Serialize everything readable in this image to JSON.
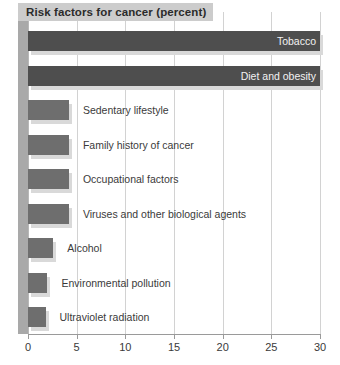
{
  "chart_data": {
    "type": "bar",
    "title": "Risk factors for cancer (percent)",
    "orientation": "horizontal",
    "xlabel": "",
    "ylabel": "",
    "xlim": [
      0,
      30
    ],
    "xticks": [
      0,
      5,
      10,
      15,
      20,
      25,
      30
    ],
    "xtick_labels": [
      "0",
      "5",
      "10",
      "15",
      "20",
      "25",
      "30"
    ],
    "grid": true,
    "legend": "none",
    "categories": [
      "Tobacco",
      "Diet and obesity",
      "Sedentary lifestyle",
      "Family history of cancer",
      "Occupational factors",
      "Viruses and other biological agents",
      "Alcohol",
      "Environmental pollution",
      "Ultraviolet radiation"
    ],
    "values": [
      30,
      30,
      4.2,
      4.2,
      4.2,
      4.2,
      2.6,
      2.0,
      1.8
    ],
    "bars": [
      {
        "label": "Tobacco",
        "value": 30,
        "color": "#4e4e4e",
        "label_position": "inside"
      },
      {
        "label": "Diet and obesity",
        "value": 30,
        "color": "#4e4e4e",
        "label_position": "inside"
      },
      {
        "label": "Sedentary lifestyle",
        "value": 4.2,
        "color": "#6e6e6e",
        "label_position": "outside"
      },
      {
        "label": "Family history of cancer",
        "value": 4.2,
        "color": "#6e6e6e",
        "label_position": "outside"
      },
      {
        "label": "Occupational factors",
        "value": 4.2,
        "color": "#6e6e6e",
        "label_position": "outside"
      },
      {
        "label": "Viruses and other biological agents",
        "value": 4.2,
        "color": "#6e6e6e",
        "label_position": "outside"
      },
      {
        "label": "Alcohol",
        "value": 2.6,
        "color": "#6e6e6e",
        "label_position": "outside"
      },
      {
        "label": "Environmental pollution",
        "value": 2.0,
        "color": "#6e6e6e",
        "label_position": "outside"
      },
      {
        "label": "Ultraviolet radiation",
        "value": 1.8,
        "color": "#6e6e6e",
        "label_position": "outside"
      }
    ],
    "colors": {
      "bar_dark": "#4e4e4e",
      "bar_medium": "#6e6e6e",
      "bar_shadow": "#d9d9d9",
      "gridline": "#d2d2d2",
      "axis": "#9a9a9a",
      "axis_band": "#a9a9a9",
      "title_background": "#cccccc",
      "text": "#3a3a3a",
      "text_inverse": "#f2f2f2",
      "background": "#ffffff"
    }
  }
}
